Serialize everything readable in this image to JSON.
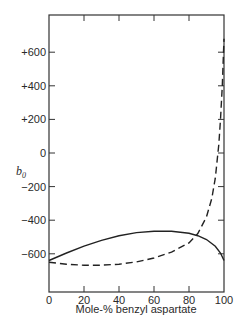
{
  "chart_data": {
    "type": "line",
    "title": "",
    "xlabel": "Mole-% benzyl aspartate",
    "ylabel": "b0",
    "xlim": [
      0,
      100
    ],
    "ylim": [
      -800,
      800
    ],
    "grid": false,
    "legend": "none",
    "x_ticks": [
      "0",
      "20",
      "40",
      "60",
      "80",
      "100"
    ],
    "y_ticks": [
      "+600",
      "+400",
      "+200",
      "0",
      "-200",
      "-400",
      "-600"
    ],
    "series": [
      {
        "name": "solid",
        "style": "solid",
        "x": [
          0,
          10,
          20,
          30,
          40,
          50,
          60,
          66,
          70,
          80,
          85,
          90,
          95,
          98,
          100
        ],
        "y": [
          -640,
          -595,
          -555,
          -520,
          -492,
          -474,
          -466,
          -465,
          -466,
          -478,
          -492,
          -515,
          -555,
          -595,
          -640
        ]
      },
      {
        "name": "dashed",
        "style": "dashed",
        "x": [
          0,
          10,
          20,
          30,
          40,
          50,
          60,
          70,
          80,
          85,
          90,
          93,
          95,
          97,
          98,
          99,
          100
        ],
        "y": [
          -650,
          -662,
          -668,
          -668,
          -662,
          -648,
          -625,
          -590,
          -535,
          -480,
          -380,
          -270,
          -150,
          50,
          200,
          400,
          680
        ]
      }
    ]
  }
}
